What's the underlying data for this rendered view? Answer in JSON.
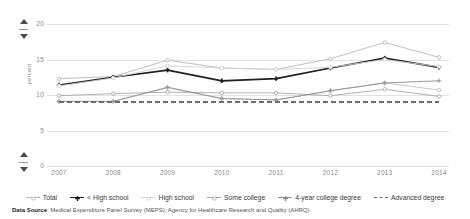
{
  "chart_data": {
    "type": "line",
    "title": "",
    "xlabel": "",
    "ylabel": "percent",
    "x": [
      2007,
      2008,
      2009,
      2010,
      2011,
      2012,
      2013,
      2014
    ],
    "xtick_labels": [
      "2007",
      "2008",
      "2009",
      "2010",
      "2011",
      "2012",
      "2013",
      "2014"
    ],
    "ylim": [
      0,
      20
    ],
    "ytick_labels": [
      "0",
      "5",
      "10",
      "15",
      "20"
    ],
    "yticks": [
      0,
      5,
      10,
      15,
      20
    ],
    "grid": true,
    "legend_position": "bottom",
    "series": [
      {
        "name": "Total",
        "color": "#b9b9b9",
        "style": "solid",
        "marker": "circle-open",
        "width": 0.9,
        "values": [
          12.3,
          12.6,
          14.9,
          13.8,
          13.6,
          15.1,
          17.4,
          15.3
        ]
      },
      {
        "name": "< High school",
        "color": "#1f1f1f",
        "style": "solid",
        "marker": "plus",
        "width": 1.7,
        "values": [
          11.4,
          12.5,
          13.5,
          12.0,
          12.3,
          13.8,
          15.2,
          13.9
        ]
      },
      {
        "name": "High school",
        "color": "#d2d2d2",
        "style": "solid",
        "marker": "circle-open",
        "width": 0.9,
        "values": [
          11.3,
          12.4,
          14.1,
          13.8,
          13.6,
          13.9,
          15.0,
          14.0
        ]
      },
      {
        "name": "Some college",
        "color": "#a8a8a8",
        "style": "solid",
        "marker": "circle-open",
        "width": 0.9,
        "values": [
          9.9,
          10.2,
          10.4,
          10.3,
          10.3,
          9.9,
          10.8,
          9.8
        ]
      },
      {
        "name": "4-year college degree",
        "color": "#8f8f8f",
        "style": "solid",
        "marker": "plus",
        "width": 0.9,
        "values": [
          9.1,
          9.1,
          11.1,
          9.5,
          9.3,
          10.6,
          11.7,
          12.0
        ]
      },
      {
        "name": "Advanced degree",
        "color": "#6e6e6e",
        "style": "dashed",
        "marker": "none",
        "width": 2.0,
        "values": [
          9.0,
          9.0,
          9.0,
          9.0,
          9.0,
          9.0,
          9.0,
          9.0
        ]
      }
    ],
    "extra_series": [
      {
        "name": "unlabeled-upper",
        "color": "#c4c4c4",
        "style": "solid",
        "marker": "circle-open",
        "width": 0.9,
        "values": [
          9.1,
          9.1,
          11.0,
          9.5,
          9.3,
          10.6,
          11.7,
          10.7
        ]
      }
    ]
  },
  "axis_controls": {
    "top_spinner": {
      "up": "increase-y-max",
      "down": "decrease-y-max"
    },
    "bottom_spinner": {
      "up": "increase-y-min",
      "down": "decrease-y-min"
    }
  },
  "source": {
    "label": "Data Source",
    "separator": ": ",
    "text": "Medical Expenditure Panel Survey (MEPS); Agency for Healthcare Research and Quality (AHRQ)"
  }
}
